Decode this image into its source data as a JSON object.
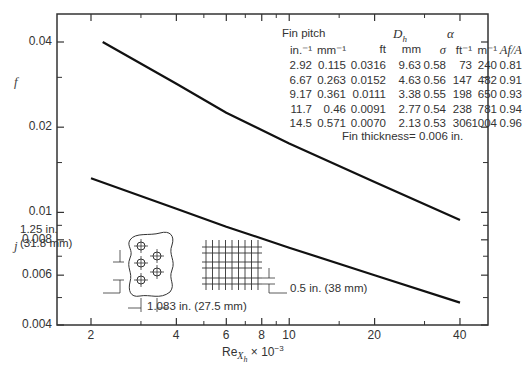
{
  "chart_data": {
    "type": "line",
    "title": "",
    "xlabel": "Re_Xh × 10^-3",
    "ylabel_upper": "f",
    "ylabel_lower": "j",
    "x_scale": "log",
    "y_scale": "log",
    "xlim": [
      1.6,
      45
    ],
    "ylim": [
      0.004,
      0.045
    ],
    "x_ticks": [
      2,
      4,
      6,
      8,
      10,
      20,
      40
    ],
    "x_tick_labels": [
      "2",
      "4",
      "6",
      "8",
      "10",
      "20",
      "40"
    ],
    "y_ticks": [
      0.004,
      0.006,
      0.008,
      0.01,
      0.02,
      0.04
    ],
    "y_tick_labels": [
      "0.004",
      "0.006",
      "0.008",
      "0.01",
      "0.02",
      "0.04"
    ],
    "grid": false,
    "series": [
      {
        "name": "f",
        "x": [
          2.2,
          4,
          6,
          10,
          20,
          40
        ],
        "values": [
          0.04,
          0.0285,
          0.0225,
          0.0175,
          0.0128,
          0.0094
        ]
      },
      {
        "name": "j",
        "x": [
          2.0,
          4,
          6,
          10,
          20,
          40
        ],
        "values": [
          0.0132,
          0.0103,
          0.0089,
          0.0075,
          0.006,
          0.0048
        ]
      }
    ],
    "annotations": [
      "Fin thickness= 0.006 in."
    ]
  },
  "axis": {
    "xlabel_main": "Re",
    "xlabel_sub": "X",
    "xlabel_subsub": "h",
    "xlabel_suffix": " × 10",
    "xlabel_exp": "−3",
    "f_label": "f",
    "j_label": "j",
    "x_ticks": [
      {
        "label": "2",
        "v": 2
      },
      {
        "label": "4",
        "v": 4
      },
      {
        "label": "6",
        "v": 6
      },
      {
        "label": "8",
        "v": 8
      },
      {
        "label": "10",
        "v": 10
      },
      {
        "label": "20",
        "v": 20
      },
      {
        "label": "40",
        "v": 40
      }
    ],
    "y_ticks": [
      {
        "label": "0.04",
        "v": 0.04
      },
      {
        "label": "0.02",
        "v": 0.02
      },
      {
        "label": "0.01",
        "v": 0.01
      },
      {
        "label": "0.008",
        "v": 0.008
      },
      {
        "label": "0.006",
        "v": 0.006
      },
      {
        "label": "0.004",
        "v": 0.004
      }
    ]
  },
  "table": {
    "group_headers": {
      "fin_pitch": "Fin pitch",
      "dh": "D",
      "dh_sub": "h",
      "alpha": "α"
    },
    "col_headers": [
      "in.⁻¹",
      "mm⁻¹",
      "ft",
      "mm",
      "σ",
      "ft⁻¹",
      "m⁻¹",
      "A_f/A"
    ],
    "rows": [
      [
        "2.92",
        "0.115",
        "0.0316",
        "9.63",
        "0.58",
        "73",
        "240",
        "0.81"
      ],
      [
        "6.67",
        "0.263",
        "0.0152",
        "4.63",
        "0.56",
        "147",
        "482",
        "0.91"
      ],
      [
        "9.17",
        "0.361",
        "0.0111",
        "3.38",
        "0.55",
        "198",
        "650",
        "0.93"
      ],
      [
        "11.7",
        "0.46",
        "0.0091",
        "2.77",
        "0.54",
        "238",
        "781",
        "0.94"
      ],
      [
        "14.5",
        "0.571",
        "0.0070",
        "2.13",
        "0.53",
        "306",
        "1004",
        "0.96"
      ]
    ],
    "fin_thickness": "Fin thickness= 0.006 in."
  },
  "inset": {
    "tube_spacing": "1.25 in.",
    "tube_spacing_mm": "(31.8 mm)",
    "row_spacing": "1.083 in. (27.5 mm)",
    "fin_spacing": "0.5 in. (38 mm)"
  }
}
